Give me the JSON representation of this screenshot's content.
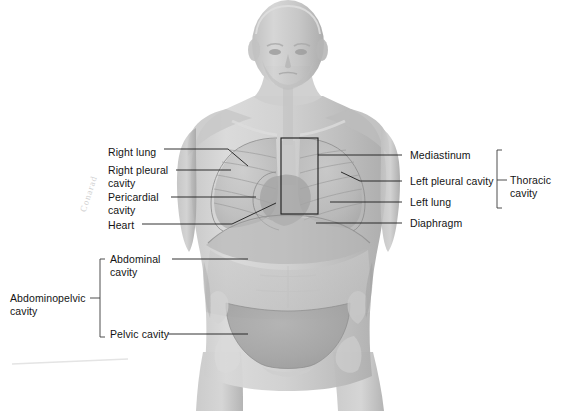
{
  "figure": {
    "background_color": "#ffffff",
    "line_color": "#1b1b1b",
    "body_tone_light": "#d8d8d8",
    "body_tone_mid": "#b4b4b4",
    "body_tone_dark": "#9a9a9a",
    "cavity_tone": "#a8a8a8"
  },
  "labels_left": [
    {
      "name": "right-lung",
      "text": "Right lung",
      "x": 108,
      "y": 146
    },
    {
      "name": "right-pleural-cavity",
      "text": "Right pleural\ncavity",
      "x": 108,
      "y": 164
    },
    {
      "name": "pericardial-cavity",
      "text": "Pericardial\ncavity",
      "x": 108,
      "y": 191
    },
    {
      "name": "heart",
      "text": "Heart",
      "x": 108,
      "y": 219
    },
    {
      "name": "abdominal-cavity",
      "text": "Abdominal\ncavity",
      "x": 110,
      "y": 256
    },
    {
      "name": "pelvic-cavity",
      "text": "Pelvic cavity",
      "x": 110,
      "y": 331
    },
    {
      "name": "abdominopelvic-cavity",
      "text": "Abdominopelvic\ncavity",
      "x": 10,
      "y": 292
    }
  ],
  "labels_right": [
    {
      "name": "mediastinum",
      "text": "Mediastinum",
      "x": 410,
      "y": 152
    },
    {
      "name": "left-pleural-cavity",
      "text": "Left pleural cavity",
      "x": 410,
      "y": 177
    },
    {
      "name": "left-lung",
      "text": "Left lung",
      "x": 410,
      "y": 199
    },
    {
      "name": "diaphragm",
      "text": "Diaphragm",
      "x": 410,
      "y": 219
    },
    {
      "name": "thoracic-cavity",
      "text": "Thoracic cavity",
      "x": 510,
      "y": 177
    }
  ],
  "annotation": {
    "handwriting": "Conarad"
  }
}
